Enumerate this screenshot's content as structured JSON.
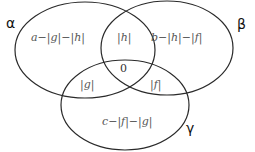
{
  "diagram": {
    "type": "venn",
    "sets": [
      {
        "name": "alpha",
        "label": "α"
      },
      {
        "name": "beta",
        "label": "β"
      },
      {
        "name": "gamma",
        "label": "γ"
      }
    ],
    "regions": {
      "alpha_only": "a−|g|−|h|",
      "beta_only": "b−|h|−|f|",
      "gamma_only": "c−|f|−|g|",
      "alpha_beta": "|h|",
      "alpha_gamma": "|g|",
      "beta_gamma": "|f|",
      "all_three": "0"
    },
    "stroke_color": "#2a2a2a"
  }
}
